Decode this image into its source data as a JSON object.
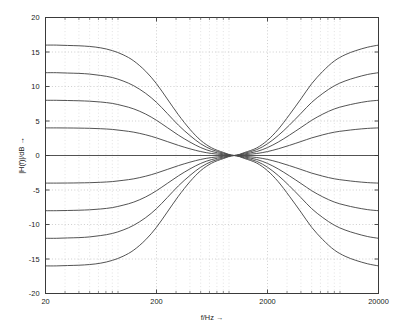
{
  "chart_data": {
    "type": "line",
    "title": "",
    "subtitle": "",
    "xlabel": "f/Hz →",
    "ylabel": "|H(f)|/dB →",
    "xscale": "log",
    "yscale": "linear",
    "xlim": [
      20,
      20000
    ],
    "ylim": [
      -20,
      20
    ],
    "xticks": [
      20,
      200,
      2000,
      20000
    ],
    "xtick_labels": [
      "20",
      "200",
      "2000",
      "20000"
    ],
    "yticks": [
      -20,
      -15,
      -10,
      -5,
      0,
      5,
      10,
      15,
      20
    ],
    "ytick_labels": [
      "-20",
      "-15",
      "-10",
      "-5",
      "0",
      "5",
      "10",
      "15",
      "20"
    ],
    "grid": true,
    "grid_style": "dotted",
    "legend": "none",
    "line_color": "#4a4a4a",
    "background": "#ffffff",
    "axis_color": "#3a3a3a",
    "low_shelf_corner_hz": 250,
    "high_shelf_corner_hz": 2500,
    "series": [
      {
        "name": "+16 dB",
        "gain_db": 16,
        "low_plateau_db": 16,
        "high_plateau_db": 16,
        "mid_db": 0,
        "points": [
          [
            20,
            16.0
          ],
          [
            25,
            16.0
          ],
          [
            31.5,
            15.95
          ],
          [
            40,
            15.9
          ],
          [
            50,
            15.8
          ],
          [
            63,
            15.6
          ],
          [
            80,
            15.2
          ],
          [
            100,
            14.6
          ],
          [
            125,
            13.7
          ],
          [
            160,
            12.2
          ],
          [
            200,
            10.4
          ],
          [
            250,
            8.2
          ],
          [
            315,
            5.9
          ],
          [
            400,
            3.8
          ],
          [
            500,
            2.2
          ],
          [
            630,
            1.1
          ],
          [
            800,
            0.45
          ],
          [
            1000,
            0.0
          ],
          [
            1250,
            0.45
          ],
          [
            1600,
            1.1
          ],
          [
            2000,
            2.2
          ],
          [
            2500,
            3.8
          ],
          [
            3150,
            5.9
          ],
          [
            4000,
            8.2
          ],
          [
            5000,
            10.4
          ],
          [
            6300,
            12.2
          ],
          [
            8000,
            13.7
          ],
          [
            10000,
            14.6
          ],
          [
            12500,
            15.2
          ],
          [
            16000,
            15.7
          ],
          [
            20000,
            16.0
          ]
        ]
      },
      {
        "name": "+12 dB",
        "gain_db": 12,
        "low_plateau_db": 12,
        "high_plateau_db": 12,
        "mid_db": 0,
        "points": [
          [
            20,
            12.0
          ],
          [
            25,
            12.0
          ],
          [
            31.5,
            11.95
          ],
          [
            40,
            11.9
          ],
          [
            50,
            11.8
          ],
          [
            63,
            11.6
          ],
          [
            80,
            11.3
          ],
          [
            100,
            10.8
          ],
          [
            125,
            10.1
          ],
          [
            160,
            9.0
          ],
          [
            200,
            7.7
          ],
          [
            250,
            6.1
          ],
          [
            315,
            4.4
          ],
          [
            400,
            2.9
          ],
          [
            500,
            1.7
          ],
          [
            630,
            0.85
          ],
          [
            800,
            0.35
          ],
          [
            1000,
            0.0
          ],
          [
            1250,
            0.35
          ],
          [
            1600,
            0.85
          ],
          [
            2000,
            1.7
          ],
          [
            2500,
            2.9
          ],
          [
            3150,
            4.4
          ],
          [
            4000,
            6.1
          ],
          [
            5000,
            7.7
          ],
          [
            6300,
            9.0
          ],
          [
            8000,
            10.1
          ],
          [
            10000,
            10.8
          ],
          [
            12500,
            11.3
          ],
          [
            16000,
            11.75
          ],
          [
            20000,
            12.0
          ]
        ]
      },
      {
        "name": "+8 dB",
        "gain_db": 8,
        "low_plateau_db": 8,
        "high_plateau_db": 8,
        "mid_db": 0,
        "points": [
          [
            20,
            8.0
          ],
          [
            25,
            8.0
          ],
          [
            31.5,
            7.97
          ],
          [
            40,
            7.93
          ],
          [
            50,
            7.87
          ],
          [
            63,
            7.75
          ],
          [
            80,
            7.55
          ],
          [
            100,
            7.2
          ],
          [
            125,
            6.75
          ],
          [
            160,
            6.0
          ],
          [
            200,
            5.1
          ],
          [
            250,
            4.05
          ],
          [
            315,
            2.95
          ],
          [
            400,
            1.95
          ],
          [
            500,
            1.15
          ],
          [
            630,
            0.58
          ],
          [
            800,
            0.23
          ],
          [
            1000,
            0.0
          ],
          [
            1250,
            0.23
          ],
          [
            1600,
            0.58
          ],
          [
            2000,
            1.15
          ],
          [
            2500,
            1.95
          ],
          [
            3150,
            2.95
          ],
          [
            4000,
            4.05
          ],
          [
            5000,
            5.1
          ],
          [
            6300,
            6.0
          ],
          [
            8000,
            6.75
          ],
          [
            10000,
            7.2
          ],
          [
            12500,
            7.55
          ],
          [
            16000,
            7.85
          ],
          [
            20000,
            8.0
          ]
        ]
      },
      {
        "name": "+4 dB",
        "gain_db": 4,
        "low_plateau_db": 4,
        "high_plateau_db": 4,
        "mid_db": 0,
        "points": [
          [
            20,
            4.0
          ],
          [
            25,
            4.0
          ],
          [
            31.5,
            3.99
          ],
          [
            40,
            3.97
          ],
          [
            50,
            3.94
          ],
          [
            63,
            3.88
          ],
          [
            80,
            3.78
          ],
          [
            100,
            3.6
          ],
          [
            125,
            3.38
          ],
          [
            160,
            3.0
          ],
          [
            200,
            2.55
          ],
          [
            250,
            2.02
          ],
          [
            315,
            1.47
          ],
          [
            400,
            0.97
          ],
          [
            500,
            0.57
          ],
          [
            630,
            0.29
          ],
          [
            800,
            0.12
          ],
          [
            1000,
            0.0
          ],
          [
            1250,
            0.12
          ],
          [
            1600,
            0.29
          ],
          [
            2000,
            0.57
          ],
          [
            2500,
            0.97
          ],
          [
            3150,
            1.47
          ],
          [
            4000,
            2.02
          ],
          [
            5000,
            2.55
          ],
          [
            6300,
            3.0
          ],
          [
            8000,
            3.38
          ],
          [
            10000,
            3.6
          ],
          [
            12500,
            3.78
          ],
          [
            16000,
            3.93
          ],
          [
            20000,
            4.0
          ]
        ]
      },
      {
        "name": "0 dB",
        "gain_db": 0,
        "low_plateau_db": 0,
        "high_plateau_db": 0,
        "mid_db": 0,
        "points": [
          [
            20,
            0.0
          ],
          [
            20000,
            0.0
          ]
        ]
      },
      {
        "name": "-4 dB",
        "gain_db": -4,
        "low_plateau_db": -4,
        "high_plateau_db": -4,
        "mid_db": 0,
        "points": [
          [
            20,
            -4.0
          ],
          [
            25,
            -4.0
          ],
          [
            31.5,
            -3.99
          ],
          [
            40,
            -3.97
          ],
          [
            50,
            -3.94
          ],
          [
            63,
            -3.88
          ],
          [
            80,
            -3.78
          ],
          [
            100,
            -3.6
          ],
          [
            125,
            -3.38
          ],
          [
            160,
            -3.0
          ],
          [
            200,
            -2.55
          ],
          [
            250,
            -2.02
          ],
          [
            315,
            -1.47
          ],
          [
            400,
            -0.97
          ],
          [
            500,
            -0.57
          ],
          [
            630,
            -0.29
          ],
          [
            800,
            -0.12
          ],
          [
            1000,
            0.0
          ],
          [
            1250,
            -0.12
          ],
          [
            1600,
            -0.29
          ],
          [
            2000,
            -0.57
          ],
          [
            2500,
            -0.97
          ],
          [
            3150,
            -1.47
          ],
          [
            4000,
            -2.02
          ],
          [
            5000,
            -2.55
          ],
          [
            6300,
            -3.0
          ],
          [
            8000,
            -3.38
          ],
          [
            10000,
            -3.6
          ],
          [
            12500,
            -3.78
          ],
          [
            16000,
            -3.93
          ],
          [
            20000,
            -4.0
          ]
        ]
      },
      {
        "name": "-8 dB",
        "gain_db": -8,
        "low_plateau_db": -8,
        "high_plateau_db": -8,
        "mid_db": 0,
        "points": [
          [
            20,
            -8.0
          ],
          [
            25,
            -8.0
          ],
          [
            31.5,
            -7.97
          ],
          [
            40,
            -7.93
          ],
          [
            50,
            -7.87
          ],
          [
            63,
            -7.75
          ],
          [
            80,
            -7.55
          ],
          [
            100,
            -7.2
          ],
          [
            125,
            -6.75
          ],
          [
            160,
            -6.0
          ],
          [
            200,
            -5.1
          ],
          [
            250,
            -4.05
          ],
          [
            315,
            -2.95
          ],
          [
            400,
            -1.95
          ],
          [
            500,
            -1.15
          ],
          [
            630,
            -0.58
          ],
          [
            800,
            -0.23
          ],
          [
            1000,
            0.0
          ],
          [
            1250,
            -0.23
          ],
          [
            1600,
            -0.58
          ],
          [
            2000,
            -1.15
          ],
          [
            2500,
            -1.95
          ],
          [
            3150,
            -2.95
          ],
          [
            4000,
            -4.05
          ],
          [
            5000,
            -5.1
          ],
          [
            6300,
            -6.0
          ],
          [
            8000,
            -6.75
          ],
          [
            10000,
            -7.2
          ],
          [
            12500,
            -7.55
          ],
          [
            16000,
            -7.85
          ],
          [
            20000,
            -8.0
          ]
        ]
      },
      {
        "name": "-12 dB",
        "gain_db": -12,
        "low_plateau_db": -12,
        "high_plateau_db": -12,
        "mid_db": 0,
        "points": [
          [
            20,
            -12.0
          ],
          [
            25,
            -12.0
          ],
          [
            31.5,
            -11.95
          ],
          [
            40,
            -11.9
          ],
          [
            50,
            -11.8
          ],
          [
            63,
            -11.6
          ],
          [
            80,
            -11.3
          ],
          [
            100,
            -10.8
          ],
          [
            125,
            -10.1
          ],
          [
            160,
            -9.0
          ],
          [
            200,
            -7.7
          ],
          [
            250,
            -6.1
          ],
          [
            315,
            -4.4
          ],
          [
            400,
            -2.9
          ],
          [
            500,
            -1.7
          ],
          [
            630,
            -0.85
          ],
          [
            800,
            -0.35
          ],
          [
            1000,
            0.0
          ],
          [
            1250,
            -0.35
          ],
          [
            1600,
            -0.85
          ],
          [
            2000,
            -1.7
          ],
          [
            2500,
            -2.9
          ],
          [
            3150,
            -4.4
          ],
          [
            4000,
            -6.1
          ],
          [
            5000,
            -7.7
          ],
          [
            6300,
            -9.0
          ],
          [
            8000,
            -10.1
          ],
          [
            10000,
            -10.8
          ],
          [
            12500,
            -11.3
          ],
          [
            16000,
            -11.75
          ],
          [
            20000,
            -12.0
          ]
        ]
      },
      {
        "name": "-16 dB",
        "gain_db": -16,
        "low_plateau_db": -16,
        "high_plateau_db": -16,
        "mid_db": 0,
        "points": [
          [
            20,
            -16.0
          ],
          [
            25,
            -16.0
          ],
          [
            31.5,
            -15.95
          ],
          [
            40,
            -15.9
          ],
          [
            50,
            -15.8
          ],
          [
            63,
            -15.6
          ],
          [
            80,
            -15.2
          ],
          [
            100,
            -14.6
          ],
          [
            125,
            -13.7
          ],
          [
            160,
            -12.2
          ],
          [
            200,
            -10.4
          ],
          [
            250,
            -8.2
          ],
          [
            315,
            -5.9
          ],
          [
            400,
            -3.8
          ],
          [
            500,
            -2.2
          ],
          [
            630,
            -1.1
          ],
          [
            800,
            -0.45
          ],
          [
            1000,
            0.0
          ],
          [
            1250,
            -0.45
          ],
          [
            1600,
            -1.1
          ],
          [
            2000,
            -2.2
          ],
          [
            2500,
            -3.8
          ],
          [
            3150,
            -5.9
          ],
          [
            4000,
            -8.2
          ],
          [
            5000,
            -10.4
          ],
          [
            6300,
            -12.2
          ],
          [
            8000,
            -13.7
          ],
          [
            10000,
            -14.6
          ],
          [
            12500,
            -15.2
          ],
          [
            16000,
            -15.7
          ],
          [
            20000,
            -16.0
          ]
        ]
      }
    ]
  }
}
